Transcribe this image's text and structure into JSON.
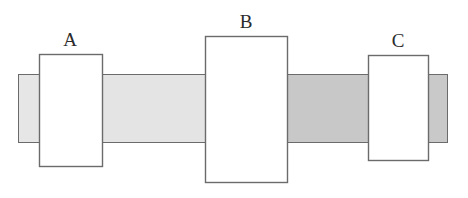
{
  "diagram": {
    "background_color": "#ffffff",
    "stroke_color": "#6b6b6b",
    "label_color": "#2b2b2b",
    "canvas": {
      "width": 468,
      "height": 198
    },
    "shaft": {
      "name": "horizontal-shaft",
      "top": 74,
      "bottom": 142,
      "left": 18,
      "right": 448,
      "segments": [
        {
          "id": "shaft-segment-left-stub",
          "label": "left end stub",
          "x": 18,
          "width": 24,
          "fill": "#e6e6e6"
        },
        {
          "id": "shaft-segment-a-to-b",
          "label": "segment between A and B",
          "x": 42,
          "width": 165,
          "fill": "#e4e4e4"
        },
        {
          "id": "shaft-segment-b-to-c",
          "label": "segment between B and C",
          "x": 287,
          "width": 84,
          "fill": "#c8c8c8"
        },
        {
          "id": "shaft-segment-right-stub",
          "label": "right end stub",
          "x": 424,
          "width": 24,
          "fill": "#c9c9c9"
        }
      ]
    },
    "blocks": [
      {
        "id": "block-a",
        "label": "A",
        "x": 39,
        "y": 54,
        "width": 63,
        "height": 112,
        "fill": "#ffffff",
        "label_x": 70,
        "label_y": 46
      },
      {
        "id": "block-b",
        "label": "B",
        "x": 205,
        "y": 36,
        "width": 82,
        "height": 146,
        "fill": "#ffffff",
        "label_x": 246,
        "label_y": 28
      },
      {
        "id": "block-c",
        "label": "C",
        "x": 368,
        "y": 55,
        "width": 60,
        "height": 105,
        "fill": "#ffffff",
        "label_x": 398,
        "label_y": 47
      }
    ]
  }
}
